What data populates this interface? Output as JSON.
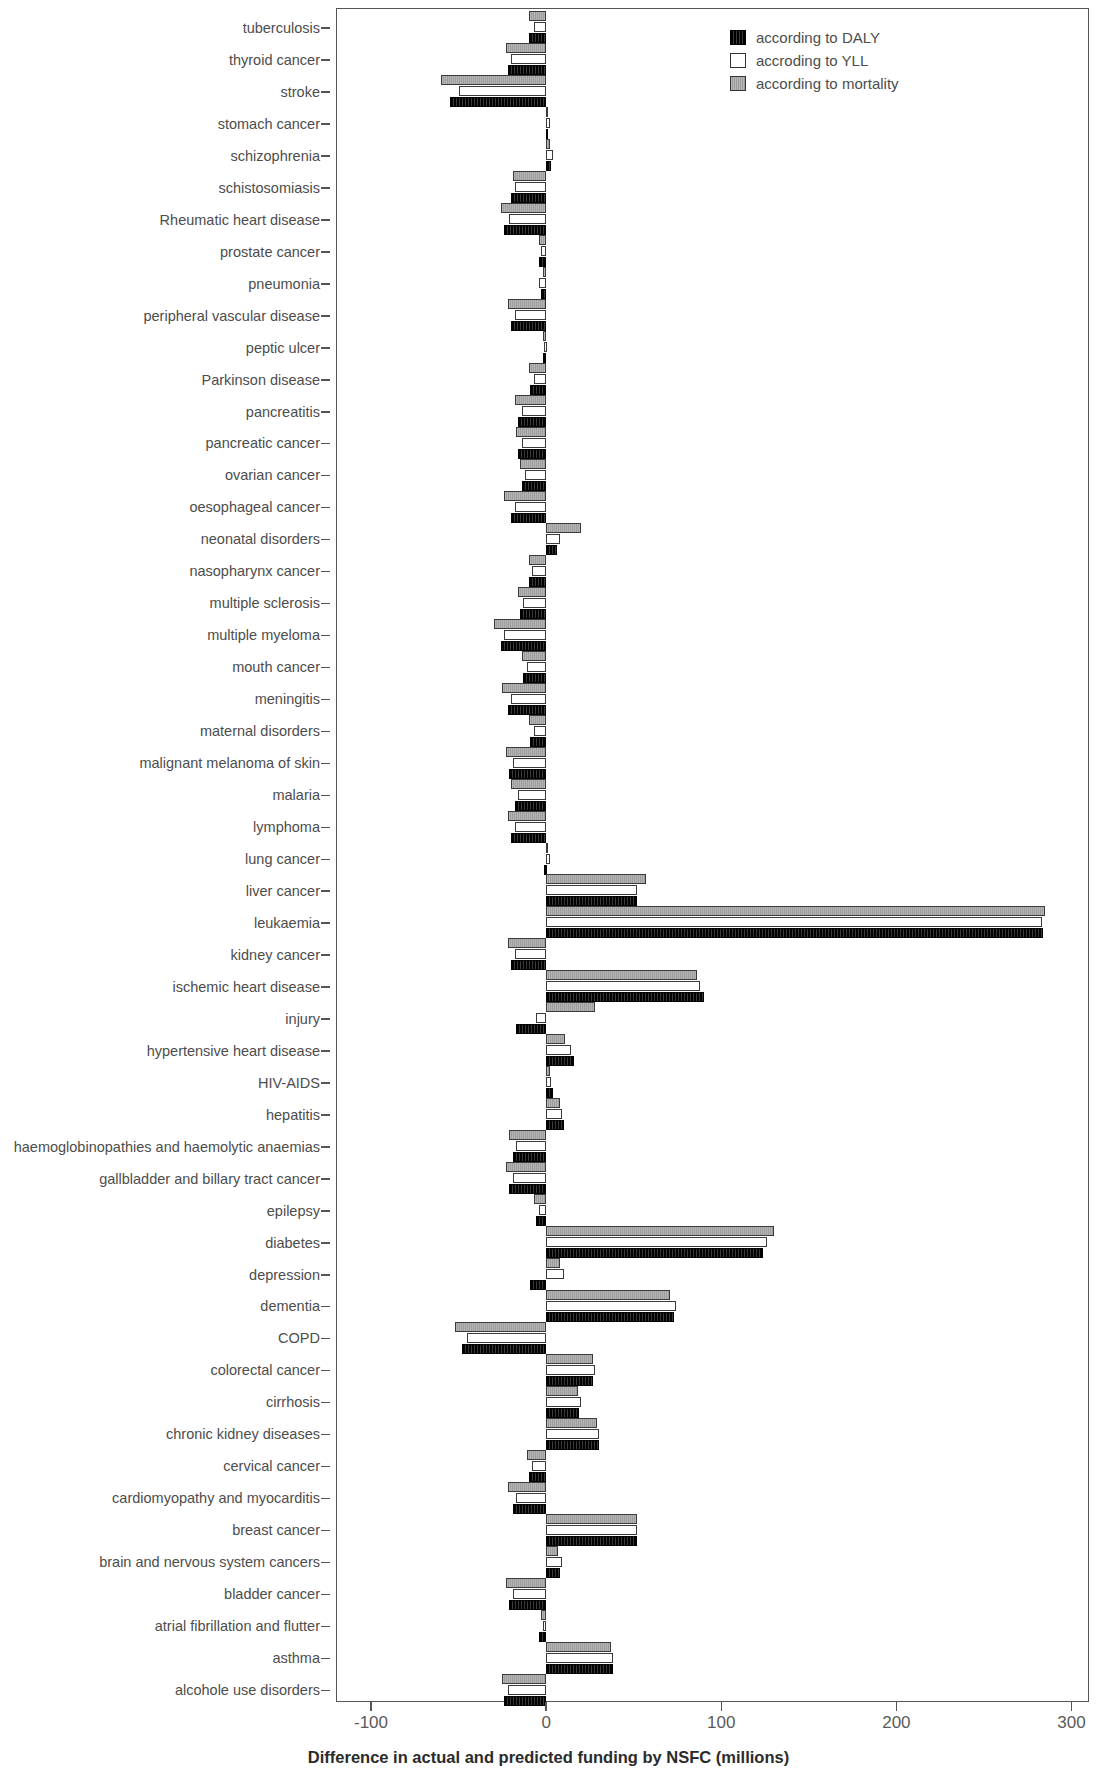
{
  "chart_data": {
    "type": "bar",
    "orientation": "horizontal",
    "title": "",
    "xlabel": "Difference in actual and predicted funding by NSFC (millions)",
    "ylabel": "",
    "xlim": [
      -120,
      310
    ],
    "xticks": [
      -100,
      0,
      100,
      200,
      300
    ],
    "xtick_labels": [
      "-100",
      "0",
      "100",
      "200",
      "300"
    ],
    "grid": false,
    "legend_position": "top-right",
    "series": [
      {
        "name": "according to DALY",
        "color": "#121212",
        "values": [
          -10,
          -22,
          -55,
          1,
          3,
          -20,
          -24,
          -4,
          -3,
          -20,
          -2,
          -9,
          -16,
          -16,
          -14,
          -20,
          6,
          -10,
          -15,
          -26,
          -13,
          -22,
          -9,
          -21,
          -18,
          -20,
          -1,
          52,
          284,
          -20,
          90,
          -17,
          16,
          4,
          10,
          -19,
          -21,
          -6,
          124,
          -9,
          73,
          -48,
          27,
          19,
          30,
          -10,
          -19,
          52,
          8,
          -21,
          -4,
          38,
          -24
        ]
      },
      {
        "name": "according to YLL",
        "color": "#ffffff",
        "values": [
          -7,
          -20,
          -50,
          2,
          4,
          -18,
          -21,
          -3,
          -4,
          -18,
          -1,
          -7,
          -14,
          -14,
          -12,
          -18,
          8,
          -8,
          -13,
          -24,
          -11,
          -20,
          -7,
          -19,
          -16,
          -18,
          2,
          52,
          283,
          -18,
          88,
          -6,
          14,
          3,
          9,
          -17,
          -19,
          -4,
          126,
          10,
          74,
          -45,
          28,
          20,
          30,
          -8,
          -17,
          52,
          9,
          -19,
          -2,
          38,
          -22
        ]
      },
      {
        "name": "according to mortality",
        "color": "#a8a8a8",
        "values": [
          -10,
          -23,
          -60,
          1,
          2,
          -19,
          -26,
          -4,
          -2,
          -22,
          -2,
          -10,
          -18,
          -17,
          -15,
          -24,
          20,
          -10,
          -16,
          -30,
          -14,
          -25,
          -10,
          -23,
          -20,
          -22,
          0,
          57,
          285,
          -22,
          86,
          28,
          11,
          2,
          8,
          -21,
          -23,
          -7,
          130,
          8,
          71,
          -52,
          27,
          18,
          29,
          -11,
          -22,
          52,
          7,
          -23,
          -3,
          37,
          -25
        ]
      }
    ],
    "categories": [
      "tuberculosis",
      "thyroid cancer",
      "stroke",
      "stomach cancer",
      "schizophrenia",
      "schistosomiasis",
      "Rheumatic heart disease",
      "prostate cancer",
      "pneumonia",
      "peripheral vascular disease",
      "peptic ulcer",
      "Parkinson disease",
      "pancreatitis",
      "pancreatic cancer",
      "ovarian cancer",
      "oesophageal cancer",
      "neonatal disorders",
      "nasopharynx cancer",
      "multiple sclerosis",
      "multiple myeloma",
      "mouth cancer",
      "meningitis",
      "maternal disorders",
      "malignant melanoma of skin",
      "malaria",
      "lymphoma",
      "lung cancer",
      "liver cancer",
      "leukaemia",
      "kidney cancer",
      "ischemic heart disease",
      "injury",
      "hypertensive heart disease",
      "HIV-AIDS",
      "hepatitis",
      "haemoglobinopathies and haemolytic anaemias",
      "gallbladder and billary tract cancer",
      "epilepsy",
      "diabetes",
      "depression",
      "dementia",
      "COPD",
      "colorectal cancer",
      "cirrhosis",
      "chronic kidney diseases",
      "cervical cancer",
      "cardiomyopathy and myocarditis",
      "breast cancer",
      "brain and nervous system cancers",
      "bladder cancer",
      "atrial fibrillation and flutter",
      "asthma",
      "alcohole use disorders"
    ]
  },
  "legend": {
    "items": [
      {
        "label": "according to DALY",
        "key": "daly"
      },
      {
        "label": "accroding to YLL",
        "key": "yll"
      },
      {
        "label": "according to mortality",
        "key": "mortality"
      }
    ]
  }
}
